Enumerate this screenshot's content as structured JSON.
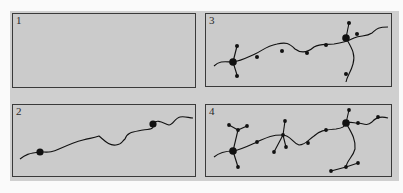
{
  "figure": {
    "panels": [
      {
        "id": "1",
        "label": "1",
        "description": "empty area"
      },
      {
        "id": "2",
        "label": "2",
        "description": "single meandering line with two large nodes"
      },
      {
        "id": "3",
        "label": "3",
        "description": "line with small nodes and two large branching hubs"
      },
      {
        "id": "4",
        "label": "4",
        "description": "denser network with additional branching hubs"
      }
    ],
    "colors": {
      "background": "#fafafa",
      "panel_fill": "#cbcbcb",
      "border": "#3a3a3a",
      "ink": "#111111"
    }
  }
}
